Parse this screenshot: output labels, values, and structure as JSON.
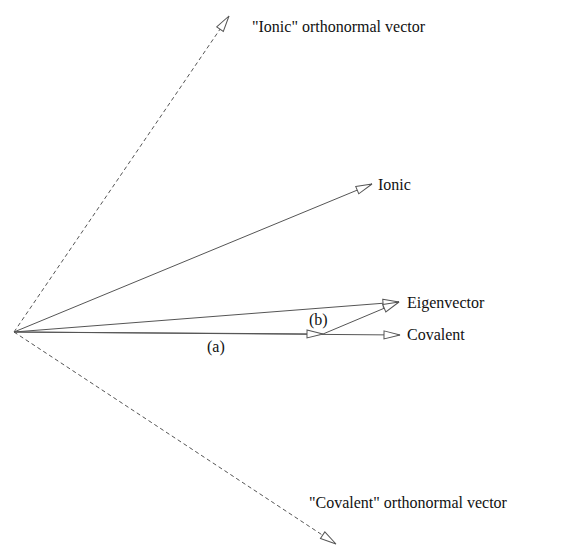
{
  "diagram": {
    "type": "vector-diagram",
    "origin": {
      "x": 14,
      "y": 332
    },
    "vectors": [
      {
        "id": "ionic-orthonormal",
        "label": "\"Ionic\" orthonormal vector",
        "style": "dashed",
        "tip": {
          "x": 229,
          "y": 16
        }
      },
      {
        "id": "ionic",
        "label": "Ionic",
        "style": "solid",
        "tip": {
          "x": 372,
          "y": 184
        }
      },
      {
        "id": "eigenvector",
        "label": "Eigenvector",
        "style": "solid",
        "tip": {
          "x": 399,
          "y": 302
        }
      },
      {
        "id": "covalent",
        "label": "Covalent",
        "style": "solid",
        "tip": {
          "x": 400,
          "y": 335
        }
      },
      {
        "id": "covalent-orthonormal",
        "label": "\"Covalent\" orthonormal vector",
        "style": "dashed",
        "tip": {
          "x": 336,
          "y": 544
        }
      }
    ],
    "components": [
      {
        "id": "a",
        "label": "(a)",
        "from": {
          "x": 14,
          "y": 332
        },
        "to": {
          "x": 323,
          "y": 334
        }
      },
      {
        "id": "b",
        "label": "(b)",
        "from": {
          "x": 323,
          "y": 334
        },
        "to": {
          "x": 399,
          "y": 302
        }
      }
    ]
  },
  "labels": {
    "ionic_orthonormal": "\"Ionic\" orthonormal vector",
    "ionic": "Ionic",
    "eigenvector": "Eigenvector",
    "covalent": "Covalent",
    "covalent_orthonormal": "\"Covalent\" orthonormal vector",
    "a": "(a)",
    "b": "(b)"
  },
  "colors": {
    "line": "#555555",
    "text": "#111111",
    "background": "#ffffff"
  }
}
